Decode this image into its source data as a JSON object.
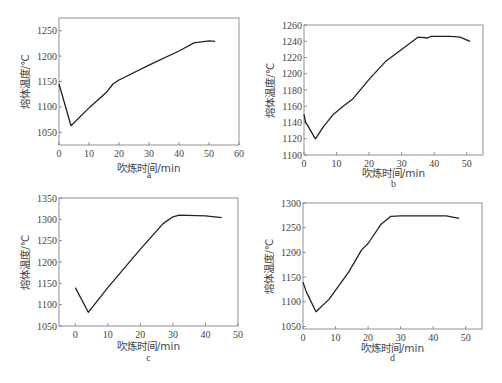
{
  "chart_data": [
    {
      "id": "a",
      "type": "line",
      "caption": "a",
      "xlabel": "吹炼时间/min",
      "ylabel": "熔体温度/℃",
      "xlim": [
        0,
        60
      ],
      "ylim": [
        1025,
        1275
      ],
      "xticks": [
        0,
        10,
        20,
        30,
        40,
        50,
        60
      ],
      "yticks": [
        1050,
        1100,
        1150,
        1200,
        1250
      ],
      "grid": false,
      "x": [
        0,
        4,
        10,
        16,
        18,
        20,
        30,
        40,
        45,
        50,
        52
      ],
      "y": [
        1145,
        1063,
        1098,
        1130,
        1145,
        1153,
        1182,
        1210,
        1226,
        1230,
        1229
      ]
    },
    {
      "id": "b",
      "type": "line",
      "caption": "b",
      "xlabel": "吹炼时间/min",
      "ylabel": "熔体温度/℃",
      "xlim": [
        0,
        55
      ],
      "ylim": [
        1100,
        1260
      ],
      "xticks": [
        0,
        10,
        20,
        30,
        40,
        50
      ],
      "yticks": [
        1100,
        1120,
        1140,
        1160,
        1180,
        1200,
        1220,
        1240,
        1260
      ],
      "grid": false,
      "x": [
        0,
        0.5,
        1,
        3.5,
        6,
        9,
        12,
        15,
        20,
        25,
        30,
        35,
        38,
        39,
        45,
        48,
        51
      ],
      "y": [
        1150,
        1140,
        1137,
        1120,
        1135,
        1150,
        1160,
        1169,
        1193,
        1215,
        1230,
        1245,
        1244,
        1246,
        1246,
        1245,
        1240
      ]
    },
    {
      "id": "c",
      "type": "line",
      "caption": "c",
      "xlabel": "吹炼时间/min",
      "ylabel": "熔体温度/℃",
      "xlim": [
        -5,
        50
      ],
      "ylim": [
        1050,
        1350
      ],
      "xticks": [
        0,
        10,
        20,
        30,
        40,
        50
      ],
      "yticks": [
        1050,
        1100,
        1150,
        1200,
        1250,
        1300,
        1350
      ],
      "grid": false,
      "x": [
        0,
        4,
        10,
        20,
        27,
        30,
        32,
        40,
        45
      ],
      "y": [
        1140,
        1082,
        1140,
        1230,
        1290,
        1306,
        1310,
        1308,
        1304
      ]
    },
    {
      "id": "d",
      "type": "line",
      "caption": "d",
      "xlabel": "吹炼时间/min",
      "ylabel": "熔体温度/℃",
      "xlim": [
        0,
        55
      ],
      "ylim": [
        1045,
        1300
      ],
      "xticks": [
        0,
        10,
        20,
        30,
        40,
        50
      ],
      "yticks": [
        1050,
        1100,
        1150,
        1200,
        1250,
        1300
      ],
      "grid": false,
      "x": [
        0,
        1,
        4,
        8,
        14,
        18,
        20,
        24,
        27,
        30,
        44,
        48
      ],
      "y": [
        1140,
        1120,
        1080,
        1105,
        1160,
        1205,
        1218,
        1257,
        1273,
        1274,
        1274,
        1269
      ]
    }
  ]
}
